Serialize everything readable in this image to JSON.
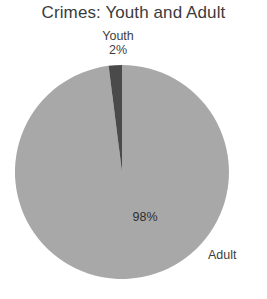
{
  "chart_data": {
    "type": "pie",
    "title": "Crimes: Youth and Adult",
    "xlabel": "",
    "ylabel": "",
    "legend": "none",
    "grid": false,
    "categories": [
      "Youth",
      "Adult"
    ],
    "values": [
      2,
      98
    ],
    "unit": "%",
    "slices": [
      {
        "label": "Youth",
        "value": 2,
        "value_label": "2%",
        "color": "#4a4a4a",
        "label_position": "outside-top"
      },
      {
        "label": "Adult",
        "value": 98,
        "value_label": "98%",
        "color": "#a8a8a8",
        "label_position": "outside-right"
      }
    ],
    "start_angle_deg": 0,
    "direction": "counterclockwise"
  },
  "title": {
    "text": "Crimes: Youth and Adult"
  },
  "youth": {
    "name": "Youth",
    "value_label": "2%"
  },
  "adult": {
    "name": "Adult",
    "value_label": "98%"
  },
  "colors": {
    "youth_slice": "#4a4a4a",
    "adult_slice": "#a8a8a8",
    "title_text": "#3b3b3b",
    "label_text": "#3d3d3d",
    "background": "#ffffff"
  }
}
